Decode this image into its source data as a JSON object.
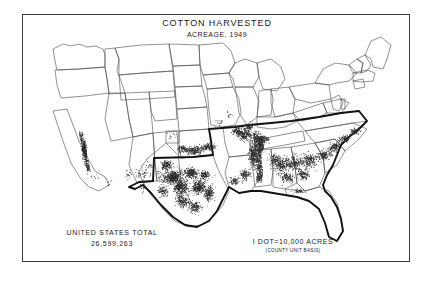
{
  "figure": {
    "title": "COTTON  HARVESTED",
    "subtitle": "ACREAGE, 1949"
  },
  "legend": {
    "total_label": "UNITED STATES TOTAL",
    "total_value": "26,599,263",
    "dot_label": "I DOT=10,000 ACRES",
    "dot_sub": "(COUNTY UNIT BASIS)"
  },
  "colors": {
    "frame": "#3a3a3a",
    "state_line": "#4a4a4a",
    "belt_outline": "#111111",
    "dot": "#2a2a2a",
    "background": "#ffffff",
    "text": "#1a1a1a"
  },
  "chart_data": {
    "type": "map",
    "map_kind": "dot-density",
    "region": "United States (contiguous)",
    "title": "COTTON HARVESTED",
    "subtitle": "ACREAGE, 1949",
    "dot_value": 10000,
    "dot_unit": "acres",
    "unit_basis": "county",
    "national_total_acres": 26599263,
    "density_clusters": [
      {
        "name": "High Plains / Central Texas",
        "intensity": "very high"
      },
      {
        "name": "Mississippi Delta (MS/AR/LA)",
        "intensity": "very high"
      },
      {
        "name": "Oklahoma southwest",
        "intensity": "high"
      },
      {
        "name": "Alabama / Georgia Black Belt",
        "intensity": "moderate"
      },
      {
        "name": "South Carolina Piedmont",
        "intensity": "moderate"
      },
      {
        "name": "California Central Valley",
        "intensity": "high"
      },
      {
        "name": "Arizona / New Mexico irrigated valleys",
        "intensity": "low"
      },
      {
        "name": "Missouri Bootheel / Tennessee west",
        "intensity": "moderate"
      }
    ]
  }
}
